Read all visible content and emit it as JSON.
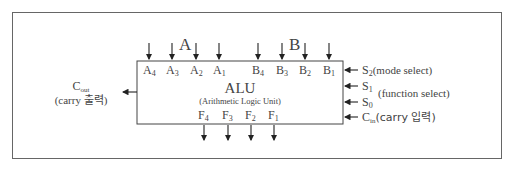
{
  "diagram": {
    "title": "ALU",
    "subtitle": "(Arithmetic Logic Unit)",
    "group_labels": {
      "a": "A",
      "b": "B"
    },
    "inputs_a": [
      {
        "base": "A",
        "sub": "4"
      },
      {
        "base": "A",
        "sub": "3"
      },
      {
        "base": "A",
        "sub": "2"
      },
      {
        "base": "A",
        "sub": "1"
      }
    ],
    "inputs_b": [
      {
        "base": "B",
        "sub": "4"
      },
      {
        "base": "B",
        "sub": "3"
      },
      {
        "base": "B",
        "sub": "2"
      },
      {
        "base": "B",
        "sub": "1"
      }
    ],
    "outputs_f": [
      {
        "base": "F",
        "sub": "4"
      },
      {
        "base": "F",
        "sub": "3"
      },
      {
        "base": "F",
        "sub": "2"
      },
      {
        "base": "F",
        "sub": "1"
      }
    ],
    "cout": {
      "base": "C",
      "sub": "out",
      "desc": "(carry 출력)"
    },
    "controls": [
      {
        "base": "S",
        "sub": "2",
        "desc": "(mode select)"
      },
      {
        "base": "S",
        "sub": "1",
        "desc": ""
      },
      {
        "base": "S",
        "sub": "0",
        "desc": ""
      },
      {
        "base": "C",
        "sub": "in",
        "desc": "(carry 입력)"
      }
    ],
    "function_select_label": "(function select)"
  }
}
